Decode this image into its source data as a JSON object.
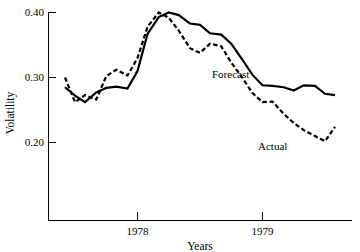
{
  "chart_data": {
    "type": "line",
    "title": "",
    "xlabel": "Years",
    "ylabel": "Volatility",
    "grid": false,
    "legend_position": "inline-annotation",
    "xlim": [
      1977.42,
      1979.58
    ],
    "ylim": [
      0.14,
      0.405
    ],
    "yticks": [
      0.2,
      0.3,
      0.4
    ],
    "ytick_labels": [
      "0.20",
      "0.30",
      "0.40"
    ],
    "xticks": [
      1978,
      1979
    ],
    "xtick_labels": [
      "1978",
      "1979"
    ],
    "series": [
      {
        "name": "Forecast",
        "style": "solid",
        "color": "#000000",
        "x": [
          1977.42,
          1977.5,
          1977.58,
          1977.67,
          1977.75,
          1977.83,
          1977.92,
          1978.0,
          1978.08,
          1978.17,
          1978.25,
          1978.33,
          1978.42,
          1978.5,
          1978.58,
          1978.67,
          1978.75,
          1978.83,
          1978.92,
          1979.0,
          1979.08,
          1979.17,
          1979.25,
          1979.33,
          1979.42,
          1979.5,
          1979.58
        ],
        "values": [
          0.285,
          0.272,
          0.262,
          0.277,
          0.284,
          0.286,
          0.283,
          0.31,
          0.367,
          0.393,
          0.4,
          0.396,
          0.383,
          0.381,
          0.368,
          0.366,
          0.352,
          0.33,
          0.304,
          0.288,
          0.287,
          0.285,
          0.28,
          0.288,
          0.287,
          0.275,
          0.273
        ]
      },
      {
        "name": "Actual",
        "style": "dashed",
        "color": "#000000",
        "x": [
          1977.42,
          1977.5,
          1977.58,
          1977.67,
          1977.75,
          1977.83,
          1977.92,
          1978.0,
          1978.08,
          1978.17,
          1978.25,
          1978.33,
          1978.42,
          1978.5,
          1978.58,
          1978.67,
          1978.75,
          1978.83,
          1978.92,
          1979.0,
          1979.08,
          1979.17,
          1979.25,
          1979.33,
          1979.42,
          1979.5,
          1979.58
        ],
        "values": [
          0.3,
          0.262,
          0.273,
          0.266,
          0.302,
          0.312,
          0.303,
          0.33,
          0.378,
          0.4,
          0.392,
          0.372,
          0.345,
          0.338,
          0.352,
          0.348,
          0.323,
          0.302,
          0.276,
          0.262,
          0.263,
          0.244,
          0.23,
          0.219,
          0.21,
          0.202,
          0.224
        ]
      }
    ],
    "annotations": [
      {
        "text": "Forecast",
        "x_px": 212,
        "y_px": 78
      },
      {
        "text": "Actual",
        "x_px": 258,
        "y_px": 150
      }
    ]
  },
  "axis": {
    "ylabel": "Volatility",
    "xlabel": "Years",
    "ytick_0": "0.40",
    "ytick_1": "0.30",
    "ytick_2": "0.20",
    "xtick_0": "1978",
    "xtick_1": "1979"
  },
  "labels": {
    "forecast": "Forecast",
    "actual": "Actual"
  }
}
